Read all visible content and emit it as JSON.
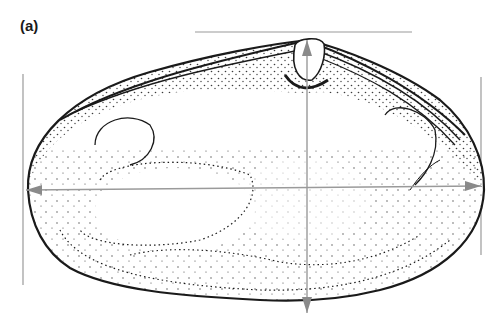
{
  "figure": {
    "panel_label": "(a)",
    "colors": {
      "ink": "#1a1a1a",
      "measure_line": "#9a9a9a",
      "background": "#ffffff"
    },
    "measurements": [
      {
        "name": "shell-length",
        "orientation": "horizontal",
        "description": "double-headed arrow across widest part"
      },
      {
        "name": "shell-height",
        "orientation": "vertical",
        "description": "arrow from umbo to ventral margin"
      },
      {
        "name": "dorsal-reference-line",
        "orientation": "horizontal"
      },
      {
        "name": "anterior-reference-line",
        "orientation": "vertical"
      },
      {
        "name": "posterior-reference-line",
        "orientation": "vertical"
      }
    ]
  }
}
